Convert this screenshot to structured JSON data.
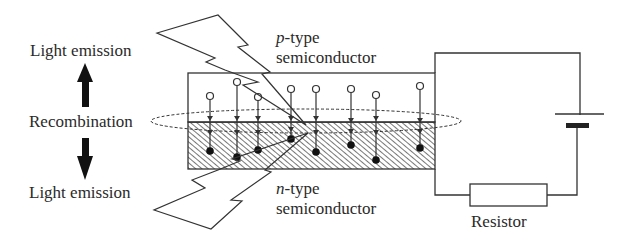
{
  "labels": {
    "light_emission_top": "Light emission",
    "light_emission_bottom": "Light emission",
    "recombination": "Recombination",
    "p_type_prefix": "p",
    "p_type_suffix": "-type",
    "p_type_line2": "semiconductor",
    "n_type_prefix": "n",
    "n_type_suffix": "-type",
    "n_type_line2": "semiconductor",
    "resistor": "Resistor"
  },
  "colors": {
    "line": "#333333",
    "hatch": "#555555",
    "background": "#ffffff"
  },
  "components": {
    "p_region": "p-type semiconductor (upper, white)",
    "n_region": "n-type semiconductor (lower, hatched)",
    "junction_ellipse": "recombination zone (dashed ellipse)",
    "battery": "DC battery",
    "resistor": "Resistor",
    "holes_count": 8,
    "electrons_count": 8
  }
}
